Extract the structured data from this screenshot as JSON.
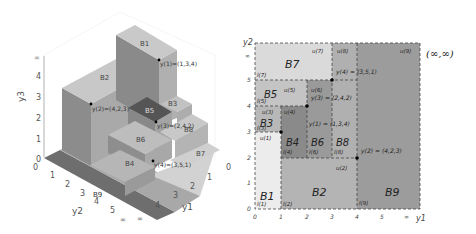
{
  "left_plot": {
    "title": "3D staircase of boxes",
    "axes": {
      "y3": {
        "label": "y3",
        "ticks": [
          "0",
          "1",
          "2",
          "3",
          "4",
          "∞"
        ]
      },
      "y2": {
        "label": "y2",
        "ticks": [
          "0",
          "1",
          "2",
          "3",
          "4",
          "5",
          "∞"
        ]
      },
      "y1": {
        "label": "y1",
        "ticks": [
          "0",
          "1",
          "2",
          "3",
          "4",
          "∞"
        ]
      }
    },
    "boxes": [
      {
        "label": "B1"
      },
      {
        "label": "B2"
      },
      {
        "label": "B3"
      },
      {
        "label": "B4"
      },
      {
        "label": "B5"
      },
      {
        "label": "B6"
      },
      {
        "label": "B7"
      },
      {
        "label": "B8"
      },
      {
        "label": "B9"
      }
    ],
    "points": [
      {
        "name": "y(1)",
        "label": "y(1)=(1,3,4)"
      },
      {
        "name": "y(2)",
        "label": "y(2)=(4,2,3)"
      },
      {
        "name": "y(3)",
        "label": "y(3)=(2,4,2)"
      },
      {
        "name": "y(4)",
        "label": "y(4)=(3,5,1)"
      }
    ]
  },
  "right_plot": {
    "title": "2D projection of boxes",
    "x_axis": {
      "label": "y1",
      "ticks": [
        "0",
        "1",
        "2",
        "3",
        "4",
        "5",
        "∞"
      ]
    },
    "y_axis": {
      "label": "y2",
      "ticks": [
        "0",
        "1",
        "2",
        "3",
        "4",
        "5",
        "∞"
      ]
    },
    "corner_label": "(∞,∞)",
    "regions": [
      {
        "label": "B1",
        "lower": "l(1)",
        "upper": "u(1)",
        "color": "#ececec"
      },
      {
        "label": "B2",
        "lower": "l(2)",
        "upper": "u(2)",
        "color": "#b4b4b4"
      },
      {
        "label": "B3",
        "lower": "l(3)",
        "upper": "u(3)",
        "color": "#b8b8b8"
      },
      {
        "label": "B4",
        "lower": "l(4)",
        "upper": "u(4)",
        "color": "#8a8a8a"
      },
      {
        "label": "B5",
        "lower": "l(5)",
        "upper": "u(5)",
        "color": "#c4c4c4"
      },
      {
        "label": "B6",
        "lower": "l(6)",
        "upper": "u(6)",
        "color": "#9a9a9a"
      },
      {
        "label": "B7",
        "lower": "l(7)",
        "upper": "u(7)",
        "color": "#dadada"
      },
      {
        "label": "B8",
        "lower": "l(8)",
        "upper": "u(8)",
        "color": "#b0b0b0"
      },
      {
        "label": "B9",
        "lower": "l(9)",
        "upper": "u(9)",
        "color": "#9c9c9c"
      }
    ],
    "points": [
      {
        "name": "y(1)",
        "label": "y(1) = (1,3,4)"
      },
      {
        "name": "y(2)",
        "label": "y(2) = (4,2,3)"
      },
      {
        "name": "y(3)",
        "label": "y(3) = (2,4,2)"
      },
      {
        "name": "y(4)",
        "label": "y(4) = (3,5,1)"
      }
    ]
  }
}
